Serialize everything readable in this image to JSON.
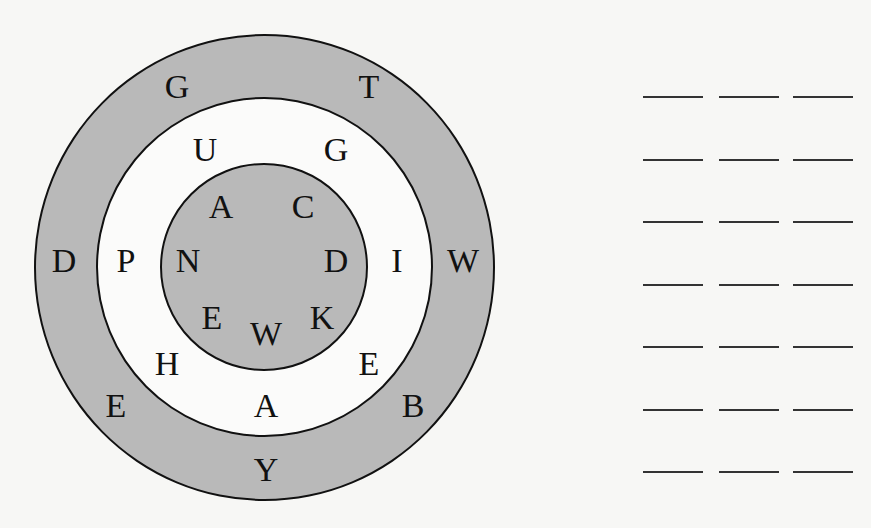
{
  "puzzle": {
    "outer_ring": {
      "fill": "#b9b9b9",
      "letters": [
        {
          "char": "G",
          "x": 177,
          "y": 87
        },
        {
          "char": "T",
          "x": 369,
          "y": 87
        },
        {
          "char": "D",
          "x": 64,
          "y": 261
        },
        {
          "char": "W",
          "x": 463,
          "y": 261
        },
        {
          "char": "E",
          "x": 116,
          "y": 406
        },
        {
          "char": "B",
          "x": 413,
          "y": 406
        },
        {
          "char": "Y",
          "x": 266,
          "y": 470
        }
      ]
    },
    "middle_ring": {
      "fill": "#fbfbfa",
      "letters": [
        {
          "char": "U",
          "x": 205,
          "y": 150
        },
        {
          "char": "G",
          "x": 336,
          "y": 150
        },
        {
          "char": "P",
          "x": 126,
          "y": 261
        },
        {
          "char": "I",
          "x": 397,
          "y": 261
        },
        {
          "char": "H",
          "x": 167,
          "y": 364
        },
        {
          "char": "E",
          "x": 369,
          "y": 364
        },
        {
          "char": "A",
          "x": 266,
          "y": 406
        }
      ]
    },
    "inner_circle": {
      "fill": "#b9b9b9",
      "letters": [
        {
          "char": "A",
          "x": 221,
          "y": 207
        },
        {
          "char": "C",
          "x": 303,
          "y": 207
        },
        {
          "char": "N",
          "x": 188,
          "y": 261
        },
        {
          "char": "D",
          "x": 336,
          "y": 261
        },
        {
          "char": "E",
          "x": 212,
          "y": 318
        },
        {
          "char": "W",
          "x": 266,
          "y": 334
        },
        {
          "char": "K",
          "x": 322,
          "y": 318
        }
      ]
    }
  },
  "answer_blanks": {
    "rows": 7,
    "blanks_per_row": 3,
    "rows_data": [
      [
        "",
        "",
        ""
      ],
      [
        "",
        "",
        ""
      ],
      [
        "",
        "",
        ""
      ],
      [
        "",
        "",
        ""
      ],
      [
        "",
        "",
        ""
      ],
      [
        "",
        "",
        ""
      ],
      [
        "",
        "",
        ""
      ]
    ]
  }
}
